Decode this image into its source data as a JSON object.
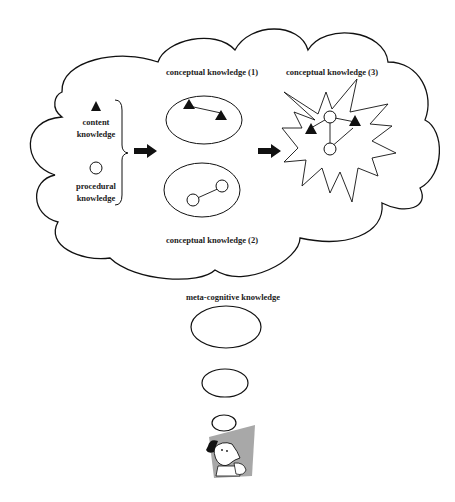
{
  "diagram": {
    "labels": {
      "content": [
        "content",
        "knowledge"
      ],
      "procedural": [
        "procedural",
        "knowledge"
      ],
      "conceptual_1": "conceptual knowledge (1)",
      "conceptual_2": "conceptual  knowledge  (2)",
      "conceptual_3": "conceptual knowledge (3)",
      "meta": "meta-cognitive knowledge"
    },
    "icons": {
      "content": "triangle-icon",
      "procedural": "circle-icon",
      "arrow": "right-arrow-icon",
      "person": "thinking-person-icon"
    },
    "colors": {
      "stroke": "#111111",
      "fill": "#ffffff",
      "person_bg": "#a8a8a8"
    }
  }
}
